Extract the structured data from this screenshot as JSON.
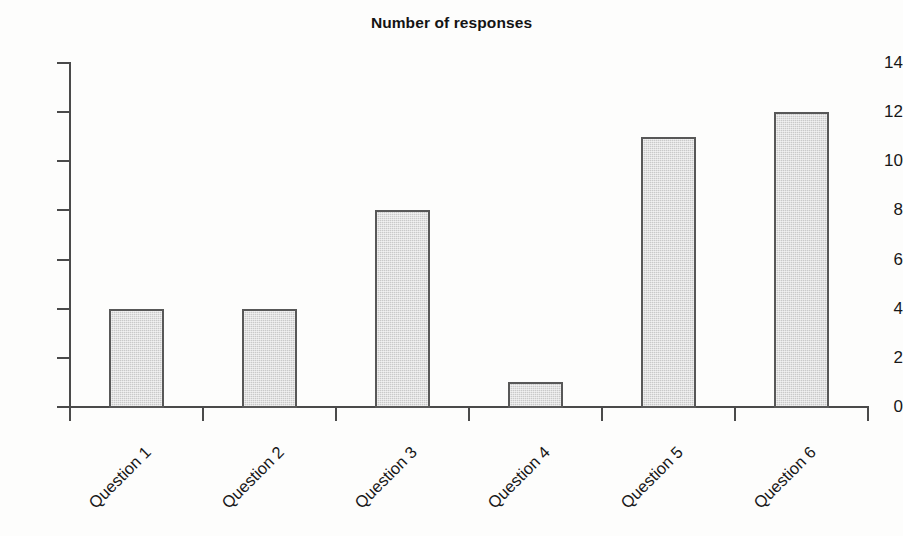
{
  "chart_data": {
    "type": "bar",
    "title": "Number of responses",
    "categories": [
      "Question 1",
      "Question 2",
      "Question 3",
      "Question 4",
      "Question 5",
      "Question 6"
    ],
    "values": [
      4,
      4,
      8,
      1,
      11,
      12
    ],
    "xlabel": "",
    "ylabel": "",
    "ylim": [
      0,
      14
    ],
    "ytick_step": 2,
    "ytick_labels": [
      "0",
      "2",
      "4",
      "6",
      "8",
      "10",
      "12",
      "14"
    ],
    "grid": false,
    "legend": false,
    "legend_position": "none",
    "xlabel_rotation_deg": -45,
    "bar_fill_color": "#c9c9c9",
    "bar_border_color": "#585858",
    "axis_color": "#4a4a4a",
    "background_color": "#fdfdfc"
  }
}
